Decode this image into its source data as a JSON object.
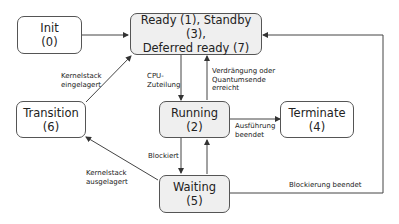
{
  "diagram": {
    "type": "state-diagram",
    "states": [
      {
        "id": "init",
        "line1": "Init",
        "line2": "(0)",
        "fill": "#ffffff"
      },
      {
        "id": "ready",
        "line1": "Ready (1), Standby (3),",
        "line2": "Deferred ready (7)",
        "fill": "#efefef"
      },
      {
        "id": "transition",
        "line1": "Transition",
        "line2": "(6)",
        "fill": "#ffffff"
      },
      {
        "id": "running",
        "line1": "Running",
        "line2": "(2)",
        "fill": "#efefef"
      },
      {
        "id": "terminate",
        "line1": "Terminate",
        "line2": "(4)",
        "fill": "#ffffff"
      },
      {
        "id": "waiting",
        "line1": "Waiting",
        "line2": "(5)",
        "fill": "#efefef"
      }
    ],
    "transitions": [
      {
        "from": "init",
        "to": "ready",
        "label": ""
      },
      {
        "from": "transition",
        "to": "ready",
        "label_l1": "Kernelstack",
        "label_l2": "eingelagert"
      },
      {
        "from": "ready",
        "to": "running",
        "label_l1": "CPU-",
        "label_l2": "Zuteilung"
      },
      {
        "from": "running",
        "to": "ready",
        "label_l1": "Verdrängung oder",
        "label_l2": "Quantumsende",
        "label_l3": "erreicht"
      },
      {
        "from": "running",
        "to": "terminate",
        "label_l1": "Ausführung",
        "label_l2": "beendet"
      },
      {
        "from": "running",
        "to": "waiting",
        "label_l1": "Blockiert"
      },
      {
        "from": "waiting",
        "to": "running",
        "label": ""
      },
      {
        "from": "waiting",
        "to": "transition",
        "label_l1": "Kernelstack",
        "label_l2": "ausgelagert"
      },
      {
        "from": "waiting",
        "to": "ready",
        "label_l1": "Blockierung beendet"
      }
    ]
  }
}
